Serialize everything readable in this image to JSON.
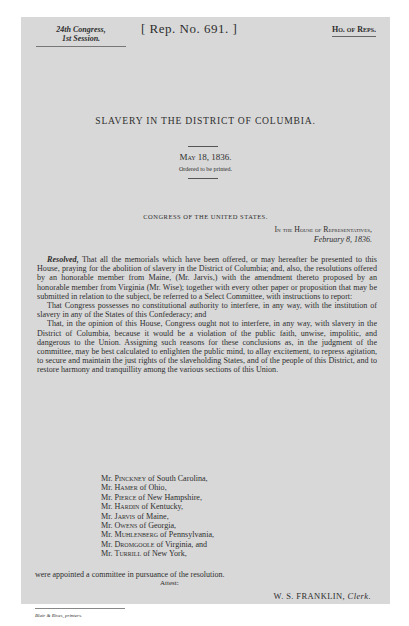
{
  "header": {
    "congress": "24th Congress,",
    "session": "1st Session.",
    "report_number": "[ Rep. No. 691. ]",
    "chamber": "Ho. of Reps."
  },
  "title": "SLAVERY IN THE DISTRICT OF COLUMBIA.",
  "date": "May 18, 1836.",
  "ordered": "Ordered to be printed.",
  "congress_line": "CONGRESS OF THE UNITED STATES.",
  "house_line": "In the House of Representatives,",
  "house_date": "February 8, 1836.",
  "resolution": {
    "label": "Resolved,",
    "paragraphs": [
      " That all the memorials which have been offered, or may hereafter be presented to this House, praying for the abolition of slavery in the District of Columbia; and, also, the resolutions offered by an honorable member from Maine, (Mr. Jarvis,) with the amendment thereto proposed by an honorable member from Virginia (Mr. Wise); together with every other paper or proposition that may be submitted in relation to the subject, be referred to a Select Committee, with instructions to report:",
      "That Congress possesses no constitutional authority to interfere, in any way, with the institution of slavery in any of the States of this Confederacy; and",
      "That, in the opinion of this House, Congress ought not to interfere, in any way, with slavery in the District of Columbia, because it would be a violation of the public faith, unwise, impolitic, and dangerous to the Union. Assigning such reasons for these conclusions as, in the judgment of the committee, may be best calculated to enlighten the public mind, to allay excitement, to repress agitation, to secure and maintain the just rights of the slaveholding States, and of the people of this District, and to restore harmony and tranquillity among the various sections of this Union."
    ]
  },
  "members": [
    {
      "prefix": "Mr. ",
      "name": "Pinckney",
      "suffix": " of South Carolina,"
    },
    {
      "prefix": "Mr. ",
      "name": "Hamer",
      "suffix": " of Ohio,"
    },
    {
      "prefix": "Mr. ",
      "name": "Pierce",
      "suffix": " of New Hampshire,"
    },
    {
      "prefix": "Mr. ",
      "name": "Hardin",
      "suffix": " of Kentucky,"
    },
    {
      "prefix": "Mr. ",
      "name": "Jarvis",
      "suffix": " of Maine,"
    },
    {
      "prefix": "Mr. ",
      "name": "Owens",
      "suffix": " of Georgia,"
    },
    {
      "prefix": "Mr. ",
      "name": "Muhlenberg",
      "suffix": " of Pennsylvania,"
    },
    {
      "prefix": "Mr. ",
      "name": "Dromgoole",
      "suffix": " of Virginia, and"
    },
    {
      "prefix": "Mr. ",
      "name": "Turrill",
      "suffix": " of New York,"
    }
  ],
  "appointed": "were appointed a committee in pursuance of the resolution.",
  "attest": "Attest:",
  "signature": {
    "name": "W. S. FRANKLIN, ",
    "title": "Clerk."
  },
  "printer": "Blair & Rives, printers."
}
